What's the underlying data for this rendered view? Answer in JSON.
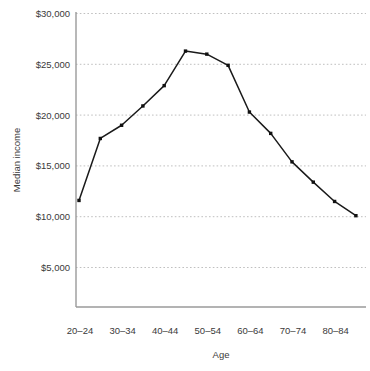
{
  "chart_data": {
    "type": "line",
    "title": "",
    "xlabel": "Age",
    "ylabel": "Median income",
    "categories": [
      "20–24",
      "25–29",
      "30–34",
      "35–39",
      "40–44",
      "45–49",
      "50–54",
      "55–59",
      "60–64",
      "65–69",
      "70–74",
      "75–79",
      "80–84",
      "85+"
    ],
    "values": [
      11600,
      17700,
      19000,
      20900,
      22900,
      26300,
      26000,
      24900,
      20300,
      18200,
      15400,
      13400,
      11500,
      10100
    ],
    "series": [
      {
        "name": "Median income",
        "values": [
          11600,
          17700,
          19000,
          20900,
          22900,
          26300,
          26000,
          24900,
          20300,
          18200,
          15400,
          13400,
          11500,
          10100
        ]
      }
    ],
    "ylim": [
      0,
      30000
    ],
    "yticks": [
      5000,
      10000,
      15000,
      20000,
      25000,
      30000
    ],
    "ytick_labels": [
      "$5,000",
      "$10,000",
      "$15,000",
      "$20,000",
      "$25,000",
      "$30,000"
    ],
    "xtick_labels": [
      "20–24",
      "30–34",
      "40–44",
      "50–54",
      "60–64",
      "70–74",
      "80–84"
    ],
    "xtick_indices": [
      0,
      2,
      4,
      6,
      8,
      10,
      12
    ],
    "grid": "horizontal-dotted",
    "legend": "none",
    "marker": "square",
    "line_color": "#1a1a1a",
    "grid_color": "#b9b9b9",
    "axis_color": "#9a9a9a"
  },
  "axis_labels": {
    "x_title": "Age",
    "y_title": "Median income"
  }
}
